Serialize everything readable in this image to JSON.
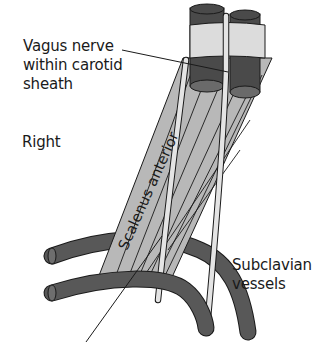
{
  "figure": {
    "type": "anatomical-diagram",
    "side": "Right"
  },
  "labels": {
    "vagus": "Vagus nerve within carotid sheath",
    "vagus_lines": [
      "Vagus nerve",
      "within carotid",
      "sheath"
    ],
    "side": "Right",
    "muscle": "Scalenus anterior",
    "subclavian_lines": [
      "Subclavian",
      "vessels"
    ]
  },
  "colors": {
    "background": "#ffffff",
    "vessel_dark": "#4a4a4a",
    "vessel_top": "#6a6a6a",
    "muscle_fill": "#b8b8b8",
    "sheath_fill": "#dcdcdc",
    "nerve_fill": "#e4e4e4",
    "outline": "#1a1a1a"
  }
}
